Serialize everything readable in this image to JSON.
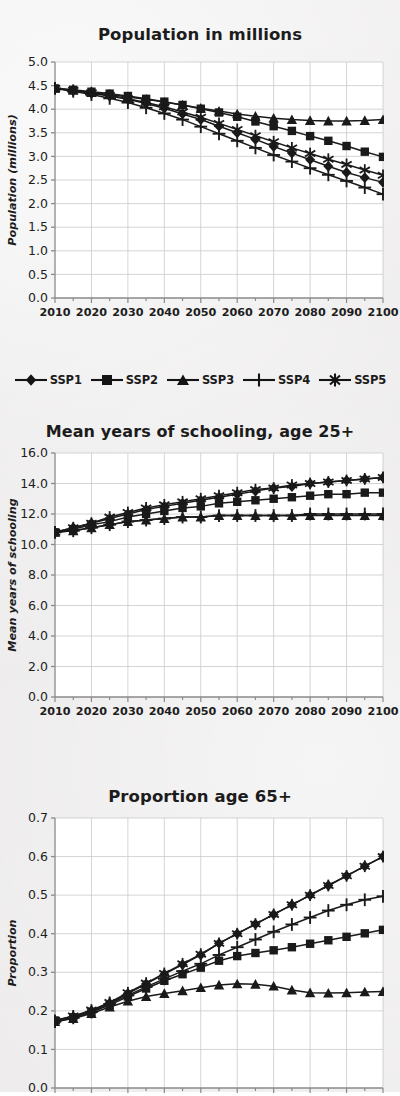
{
  "page": {
    "background_hex": "#eceaea",
    "ink_hex": "#1a1a1a",
    "grid_hex": "#c9c9c9",
    "axis_hex": "#8a8a8a",
    "plot_bg_hex": "#ffffff"
  },
  "legend": {
    "position": "below-first-chart",
    "items": [
      {
        "label": "SSP1",
        "marker": "diamond"
      },
      {
        "label": "SSP2",
        "marker": "square"
      },
      {
        "label": "SSP3",
        "marker": "triangle"
      },
      {
        "label": "SSP4",
        "marker": "plus"
      },
      {
        "label": "SSP5",
        "marker": "asterisk"
      }
    ]
  },
  "chart_data": [
    {
      "id": "population",
      "type": "line",
      "title": "Population in millions",
      "xlabel": "",
      "ylabel": "Population (millions)",
      "x": [
        2010,
        2015,
        2020,
        2025,
        2030,
        2035,
        2040,
        2045,
        2050,
        2055,
        2060,
        2065,
        2070,
        2075,
        2080,
        2085,
        2090,
        2095,
        2100
      ],
      "xticks": [
        2010,
        2020,
        2030,
        2040,
        2050,
        2060,
        2070,
        2080,
        2090,
        2100
      ],
      "xlim": [
        2010,
        2100
      ],
      "ylim": [
        0.0,
        5.0
      ],
      "yticks": [
        0.0,
        0.5,
        1.0,
        1.5,
        2.0,
        2.5,
        3.0,
        3.5,
        4.0,
        4.5,
        5.0
      ],
      "grid": true,
      "series": [
        {
          "name": "SSP1",
          "marker": "diamond",
          "values": [
            4.44,
            4.4,
            4.34,
            4.28,
            4.21,
            4.12,
            4.02,
            3.9,
            3.78,
            3.64,
            3.5,
            3.36,
            3.21,
            3.07,
            2.93,
            2.79,
            2.66,
            2.55,
            2.45
          ]
        },
        {
          "name": "SSP2",
          "marker": "square",
          "values": [
            4.44,
            4.41,
            4.37,
            4.33,
            4.28,
            4.22,
            4.16,
            4.09,
            4.01,
            3.93,
            3.84,
            3.74,
            3.64,
            3.54,
            3.43,
            3.33,
            3.22,
            3.1,
            2.99
          ]
        },
        {
          "name": "SSP3",
          "marker": "triangle",
          "values": [
            4.44,
            4.4,
            4.35,
            4.31,
            4.26,
            4.21,
            4.15,
            4.09,
            4.02,
            3.96,
            3.9,
            3.85,
            3.81,
            3.78,
            3.76,
            3.75,
            3.75,
            3.76,
            3.78
          ]
        },
        {
          "name": "SSP4",
          "marker": "plus",
          "values": [
            4.44,
            4.38,
            4.31,
            4.23,
            4.14,
            4.03,
            3.91,
            3.78,
            3.63,
            3.48,
            3.33,
            3.18,
            3.03,
            2.89,
            2.75,
            2.61,
            2.48,
            2.34,
            2.2
          ]
        },
        {
          "name": "SSP5",
          "marker": "asterisk",
          "values": [
            4.44,
            4.4,
            4.35,
            4.29,
            4.22,
            4.14,
            4.05,
            3.94,
            3.83,
            3.7,
            3.57,
            3.44,
            3.31,
            3.18,
            3.06,
            2.94,
            2.83,
            2.71,
            2.6
          ]
        }
      ]
    },
    {
      "id": "schooling",
      "type": "line",
      "title": "Mean years of schooling, age 25+",
      "xlabel": "",
      "ylabel": "Mean years of schooling",
      "x": [
        2010,
        2015,
        2020,
        2025,
        2030,
        2035,
        2040,
        2045,
        2050,
        2055,
        2060,
        2065,
        2070,
        2075,
        2080,
        2085,
        2090,
        2095,
        2100
      ],
      "xticks": [
        2010,
        2020,
        2030,
        2040,
        2050,
        2060,
        2070,
        2080,
        2090,
        2100
      ],
      "xlim": [
        2010,
        2100
      ],
      "ylim": [
        0.0,
        16.0
      ],
      "yticks": [
        0.0,
        2.0,
        4.0,
        6.0,
        8.0,
        10.0,
        12.0,
        14.0,
        16.0
      ],
      "grid": true,
      "series": [
        {
          "name": "SSP1",
          "marker": "diamond",
          "values": [
            10.8,
            11.1,
            11.4,
            11.7,
            12.0,
            12.3,
            12.5,
            12.7,
            12.9,
            13.1,
            13.3,
            13.5,
            13.7,
            13.8,
            14.0,
            14.1,
            14.2,
            14.3,
            14.4
          ]
        },
        {
          "name": "SSP2",
          "marker": "square",
          "values": [
            10.8,
            11.0,
            11.3,
            11.5,
            11.8,
            12.0,
            12.2,
            12.4,
            12.5,
            12.7,
            12.8,
            12.9,
            13.0,
            13.1,
            13.2,
            13.3,
            13.3,
            13.4,
            13.4
          ]
        },
        {
          "name": "SSP3",
          "marker": "triangle",
          "values": [
            10.8,
            10.9,
            11.1,
            11.3,
            11.5,
            11.6,
            11.7,
            11.8,
            11.8,
            11.9,
            11.9,
            11.9,
            11.9,
            11.9,
            11.9,
            11.9,
            11.9,
            11.9,
            11.9
          ]
        },
        {
          "name": "SSP4",
          "marker": "plus",
          "values": [
            10.8,
            10.9,
            11.1,
            11.3,
            11.5,
            11.6,
            11.7,
            11.8,
            11.8,
            11.9,
            11.9,
            11.9,
            11.9,
            11.9,
            12.0,
            12.0,
            12.0,
            12.0,
            12.0
          ]
        },
        {
          "name": "SSP5",
          "marker": "asterisk",
          "values": [
            10.8,
            11.1,
            11.4,
            11.8,
            12.1,
            12.4,
            12.6,
            12.8,
            13.0,
            13.2,
            13.4,
            13.6,
            13.7,
            13.9,
            14.0,
            14.1,
            14.2,
            14.3,
            14.4
          ]
        }
      ]
    },
    {
      "id": "proportion65",
      "type": "line",
      "title": "Proportion age 65+",
      "xlabel": "",
      "ylabel": "Proportion",
      "x": [
        2010,
        2015,
        2020,
        2025,
        2030,
        2035,
        2040,
        2045,
        2050,
        2055,
        2060,
        2065,
        2070,
        2075,
        2080,
        2085,
        2090,
        2095,
        2100
      ],
      "xticks": [
        2010,
        2020,
        2030,
        2040,
        2050,
        2060,
        2070,
        2080,
        2090,
        2100
      ],
      "xlim": [
        2010,
        2100
      ],
      "ylim": [
        0.0,
        0.7
      ],
      "yticks": [
        0.0,
        0.1,
        0.2,
        0.3,
        0.4,
        0.5,
        0.6,
        0.7
      ],
      "grid": true,
      "cropped_at_bottom": true,
      "series": [
        {
          "name": "SSP1",
          "marker": "diamond",
          "values": [
            0.175,
            0.185,
            0.2,
            0.22,
            0.245,
            0.27,
            0.295,
            0.32,
            0.345,
            0.375,
            0.4,
            0.425,
            0.45,
            0.475,
            0.5,
            0.525,
            0.55,
            0.575,
            0.6
          ]
        },
        {
          "name": "SSP2",
          "marker": "square",
          "values": [
            0.175,
            0.183,
            0.197,
            0.215,
            0.237,
            0.258,
            0.278,
            0.295,
            0.312,
            0.33,
            0.342,
            0.35,
            0.357,
            0.365,
            0.374,
            0.383,
            0.392,
            0.401,
            0.41
          ]
        },
        {
          "name": "SSP3",
          "marker": "triangle",
          "values": [
            0.172,
            0.18,
            0.193,
            0.21,
            0.225,
            0.237,
            0.245,
            0.252,
            0.26,
            0.267,
            0.27,
            0.269,
            0.264,
            0.254,
            0.247,
            0.246,
            0.247,
            0.249,
            0.25
          ]
        },
        {
          "name": "SSP4",
          "marker": "plus",
          "values": [
            0.172,
            0.182,
            0.197,
            0.218,
            0.24,
            0.262,
            0.283,
            0.303,
            0.322,
            0.345,
            0.365,
            0.385,
            0.405,
            0.424,
            0.442,
            0.46,
            0.475,
            0.488,
            0.497
          ]
        },
        {
          "name": "SSP5",
          "marker": "asterisk",
          "values": [
            0.175,
            0.187,
            0.202,
            0.222,
            0.247,
            0.272,
            0.297,
            0.322,
            0.347,
            0.375,
            0.4,
            0.425,
            0.45,
            0.475,
            0.5,
            0.525,
            0.55,
            0.575,
            0.6
          ]
        }
      ]
    }
  ]
}
